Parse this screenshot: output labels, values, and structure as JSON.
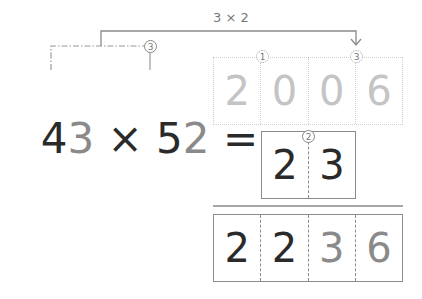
{
  "annotation": {
    "label": "3 × 2"
  },
  "equation": {
    "tokens": [
      {
        "text": "4",
        "tone": "dark"
      },
      {
        "text": "3",
        "tone": "grey"
      },
      {
        "text": " × ",
        "tone": "dark"
      },
      {
        "text": "5",
        "tone": "dark"
      },
      {
        "text": "2",
        "tone": "grey"
      },
      {
        "text": " =",
        "tone": "dark"
      }
    ]
  },
  "markers": {
    "bracket_marker": "3",
    "step1": "1",
    "step2": "2",
    "step3": "3"
  },
  "partial_products": {
    "row1": [
      "2",
      "0",
      "0",
      "6"
    ],
    "row2": [
      "2",
      "3"
    ]
  },
  "result": {
    "digits": [
      "2",
      "2",
      "3",
      "6"
    ]
  },
  "colors": {
    "dark": "#2a2a2a",
    "grey": "#8a8a8a",
    "faint": "#c4c4c4",
    "line": "#8c8c8c"
  }
}
